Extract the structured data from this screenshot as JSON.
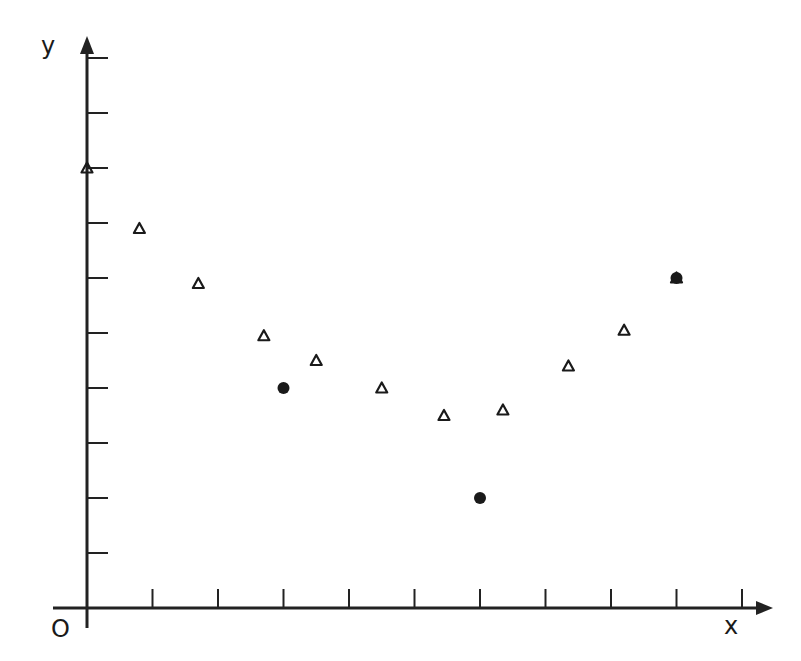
{
  "chart_data": {
    "type": "scatter",
    "title": "",
    "xlabel": "x",
    "ylabel": "y",
    "origin_label": "O",
    "xlim": [
      0,
      10.4
    ],
    "ylim": [
      0,
      10.4
    ],
    "x_ticks": [
      1,
      2,
      3,
      4,
      5,
      6,
      7,
      8,
      9,
      10
    ],
    "y_ticks": [
      1,
      2,
      3,
      4,
      5,
      6,
      7,
      8,
      9,
      10
    ],
    "tick_labels_shown": false,
    "grid": false,
    "legend": null,
    "series": [
      {
        "name": "triangles",
        "marker": "open-triangle",
        "points": [
          {
            "x": 0.0,
            "y": 8.0
          },
          {
            "x": 0.8,
            "y": 6.9
          },
          {
            "x": 1.7,
            "y": 5.9
          },
          {
            "x": 2.7,
            "y": 4.95
          },
          {
            "x": 3.5,
            "y": 4.5
          },
          {
            "x": 4.5,
            "y": 4.0
          },
          {
            "x": 5.45,
            "y": 3.5
          },
          {
            "x": 6.35,
            "y": 3.6
          },
          {
            "x": 7.35,
            "y": 4.4
          },
          {
            "x": 8.2,
            "y": 5.05
          },
          {
            "x": 9.0,
            "y": 6.0
          }
        ]
      },
      {
        "name": "dots",
        "marker": "filled-circle",
        "points": [
          {
            "x": 3.0,
            "y": 4.0
          },
          {
            "x": 6.0,
            "y": 2.0
          },
          {
            "x": 9.0,
            "y": 6.0
          }
        ]
      }
    ],
    "colors": {
      "axis": "#222222",
      "marker": "#1a1a1a",
      "background": "#ffffff"
    }
  }
}
